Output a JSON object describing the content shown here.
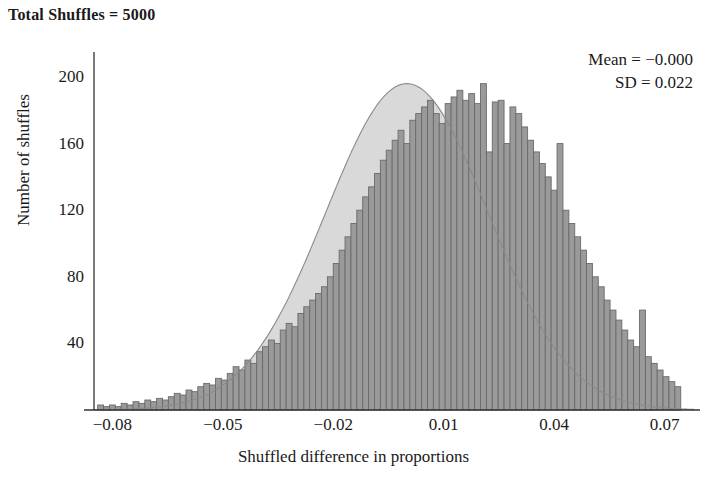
{
  "title": "Total Shuffles = 5000",
  "annotations": {
    "mean_label": "Mean = −0.000",
    "sd_label": "SD = 0.022"
  },
  "colors": {
    "bar_fill": "#9a9a9a",
    "bar_edge": "#6a6a6a",
    "curve_fill": "#d9d9d9",
    "curve_line": "#8a8a8a",
    "axis": "#333333",
    "text": "#1a1a1a"
  },
  "chart_data": {
    "type": "bar",
    "title": "Total Shuffles = 5000",
    "xlabel": "Shuffled difference in proportions",
    "ylabel": "Number of shuffles",
    "xlim": [
      -0.085,
      0.078
    ],
    "ylim": [
      0,
      215
    ],
    "grid": false,
    "legend": null,
    "xticks": [
      -0.08,
      -0.05,
      -0.02,
      0.01,
      0.04,
      0.07
    ],
    "xticklabels": [
      "−0.08",
      "−0.05",
      "−0.02",
      "0.01",
      "0.04",
      "0.07"
    ],
    "yticks": [
      40,
      80,
      120,
      160,
      200
    ],
    "yticklabels": [
      "40",
      "80",
      "120",
      "160",
      "200"
    ],
    "bin_width": 0.0016,
    "bin_starts": [
      -0.084,
      -0.0824,
      -0.0808,
      -0.0792,
      -0.0776,
      -0.076,
      -0.0744,
      -0.0728,
      -0.0712,
      -0.0696,
      -0.068,
      -0.0664,
      -0.0648,
      -0.0632,
      -0.0616,
      -0.06,
      -0.0584,
      -0.0568,
      -0.0552,
      -0.0536,
      -0.052,
      -0.0504,
      -0.0488,
      -0.0472,
      -0.0456,
      -0.044,
      -0.0424,
      -0.0408,
      -0.0392,
      -0.0376,
      -0.036,
      -0.0344,
      -0.0328,
      -0.0312,
      -0.0296,
      -0.028,
      -0.0264,
      -0.0248,
      -0.0232,
      -0.0216,
      -0.02,
      -0.0184,
      -0.0168,
      -0.0152,
      -0.0136,
      -0.012,
      -0.0104,
      -0.0088,
      -0.0072,
      -0.0056,
      -0.004,
      -0.0024,
      -0.0008,
      0.0008,
      0.0024,
      0.004,
      0.0056,
      0.0072,
      0.0088,
      0.0104,
      0.012,
      0.0136,
      0.0152,
      0.0168,
      0.0184,
      0.02,
      0.0216,
      0.0232,
      0.0248,
      0.0264,
      0.028,
      0.0296,
      0.0312,
      0.0328,
      0.0344,
      0.036,
      0.0376,
      0.0392,
      0.0408,
      0.0424,
      0.044,
      0.0456,
      0.0472,
      0.0488,
      0.0504,
      0.052,
      0.0536,
      0.0552,
      0.0568,
      0.0584,
      0.06,
      0.0616,
      0.0632,
      0.0648,
      0.0664,
      0.068,
      0.0696,
      0.0712,
      0.0728
    ],
    "counts": [
      3,
      2,
      3,
      2,
      4,
      3,
      5,
      4,
      6,
      5,
      7,
      6,
      8,
      10,
      9,
      12,
      11,
      14,
      16,
      15,
      19,
      18,
      22,
      26,
      24,
      30,
      28,
      35,
      38,
      42,
      40,
      48,
      52,
      50,
      58,
      62,
      66,
      70,
      74,
      80,
      88,
      96,
      104,
      112,
      120,
      128,
      134,
      142,
      150,
      156,
      162,
      168,
      160,
      174,
      178,
      182,
      186,
      178,
      172,
      184,
      188,
      192,
      186,
      190,
      184,
      196,
      155,
      185,
      186,
      160,
      182,
      178,
      170,
      162,
      155,
      148,
      140,
      132,
      160,
      120,
      112,
      104,
      96,
      88,
      80,
      74,
      66,
      60,
      54,
      48,
      42,
      38,
      60,
      32,
      28,
      24,
      20,
      17,
      14,
      12,
      10,
      8,
      7,
      6,
      12,
      10,
      5,
      4,
      3,
      2
    ],
    "curve": {
      "type": "normal",
      "mean": 0.0,
      "sd": 0.022,
      "peak_count": 196,
      "description": "Normal density overlay scaled to histogram area"
    }
  }
}
